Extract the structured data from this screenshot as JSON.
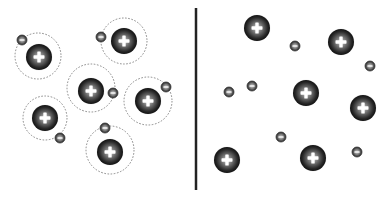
{
  "diagram": {
    "colors": {
      "background": "#ffffff",
      "divider": "#222222",
      "orbit": "#888888",
      "particle_dark": "#1e1e1e",
      "particle_mid": "#555555",
      "particle_light": "#9a9a9a",
      "plus": "#ffffff"
    },
    "divider": {
      "x": 196,
      "y1": 8,
      "y2": 190,
      "width": 2.5
    },
    "nucleus_radius": 13,
    "electron_radius": 5,
    "left_panel": {
      "label": "bound atoms",
      "atoms": [
        {
          "nucleus": [
            39,
            57
          ],
          "orbit": [
            38,
            56,
            23
          ],
          "electron": [
            22,
            40
          ]
        },
        {
          "nucleus": [
            124,
            41
          ],
          "orbit": [
            124,
            41,
            23
          ],
          "electron": [
            101,
            37
          ]
        },
        {
          "nucleus": [
            91,
            91
          ],
          "orbit": [
            91,
            88,
            24
          ],
          "electron": [
            113,
            93
          ]
        },
        {
          "nucleus": [
            148,
            101
          ],
          "orbit": [
            148,
            101,
            24
          ],
          "electron": [
            166,
            87
          ]
        },
        {
          "nucleus": [
            45,
            118
          ],
          "orbit": [
            45,
            118,
            22
          ],
          "electron": [
            60,
            138
          ]
        },
        {
          "nucleus": [
            110,
            152
          ],
          "orbit": [
            110,
            150,
            24
          ],
          "electron": [
            105,
            128
          ]
        }
      ]
    },
    "right_panel": {
      "label": "free nuclei and electrons",
      "nuclei": [
        [
          257,
          28
        ],
        [
          341,
          42
        ],
        [
          306,
          93
        ],
        [
          363,
          108
        ],
        [
          227,
          160
        ],
        [
          313,
          158
        ]
      ],
      "electrons": [
        [
          295,
          46
        ],
        [
          370,
          66
        ],
        [
          229,
          92
        ],
        [
          252,
          86
        ],
        [
          281,
          137
        ],
        [
          357,
          152
        ]
      ]
    }
  }
}
